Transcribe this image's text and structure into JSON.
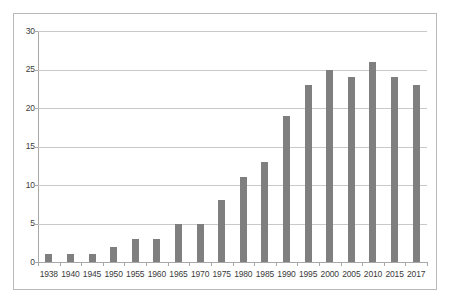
{
  "chart_data": {
    "type": "bar",
    "title": "",
    "subtitle": "",
    "xlabel": "",
    "ylabel": "",
    "categories": [
      "1938",
      "1940",
      "1945",
      "1950",
      "1955",
      "1960",
      "1965",
      "1970",
      "1975",
      "1980",
      "1985",
      "1990",
      "1995",
      "2000",
      "2005",
      "2010",
      "2015",
      "2017"
    ],
    "values": [
      1,
      1,
      1,
      2,
      3,
      3,
      5,
      5,
      8,
      11,
      13,
      19,
      23,
      25,
      24,
      26,
      24,
      23
    ],
    "series": [
      {
        "name": "",
        "values": [
          1,
          1,
          1,
          2,
          3,
          3,
          5,
          5,
          8,
          11,
          13,
          19,
          23,
          25,
          24,
          26,
          24,
          23
        ]
      }
    ],
    "ylim": [
      0,
      30
    ],
    "y_ticks": [
      0,
      5,
      10,
      15,
      20,
      25,
      30
    ],
    "y_tick_labels": [
      "0",
      "5",
      "10",
      "15",
      "20",
      "25",
      "30"
    ],
    "grid": true,
    "grid_axis": "y",
    "legend": false,
    "legend_position": "none",
    "annotations": [],
    "bar_color": "#7f7f7f",
    "gridline_color": "#c9c9c9",
    "axis_color": "#a8a8a8",
    "frame_color": "#b9b9b9",
    "background_color": "#ffffff",
    "text_color": "#3b3b3b"
  }
}
